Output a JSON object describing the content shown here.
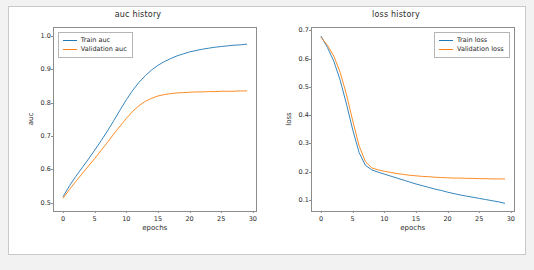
{
  "figure": {
    "background": "#ffffff",
    "page_background": "#f2f2f2",
    "border_color": "#c9c9c9"
  },
  "chart_data": [
    {
      "type": "line",
      "title": "auc history",
      "xlabel": "epochs",
      "ylabel": "auc",
      "xlim": [
        -1.45,
        30.45
      ],
      "ylim": [
        0.4755,
        1.0245
      ],
      "xticks": [
        "0",
        "5",
        "10",
        "15",
        "20",
        "25",
        "30"
      ],
      "xtick_values": [
        0,
        5,
        10,
        15,
        20,
        25,
        30
      ],
      "yticks": [
        "0.5",
        "0.6",
        "0.7",
        "0.8",
        "0.9",
        "1.0"
      ],
      "ytick_values": [
        0.5,
        0.6,
        0.7,
        0.8,
        0.9,
        1.0
      ],
      "grid": false,
      "legend_position": "upper left",
      "x": [
        0,
        1,
        2,
        3,
        4,
        5,
        6,
        7,
        8,
        9,
        10,
        11,
        12,
        13,
        14,
        15,
        16,
        17,
        18,
        19,
        20,
        21,
        22,
        23,
        24,
        25,
        26,
        27,
        28,
        29
      ],
      "series": [
        {
          "name": "Train auc",
          "color": "#1f77b4",
          "values": [
            0.52,
            0.552,
            0.58,
            0.606,
            0.632,
            0.659,
            0.687,
            0.716,
            0.747,
            0.779,
            0.81,
            0.838,
            0.862,
            0.882,
            0.899,
            0.913,
            0.924,
            0.933,
            0.941,
            0.947,
            0.953,
            0.957,
            0.961,
            0.964,
            0.967,
            0.969,
            0.971,
            0.973,
            0.974,
            0.976
          ]
        },
        {
          "name": "Validation auc",
          "color": "#ff7f0e",
          "values": [
            0.515,
            0.541,
            0.565,
            0.588,
            0.611,
            0.634,
            0.658,
            0.682,
            0.707,
            0.731,
            0.754,
            0.775,
            0.792,
            0.805,
            0.814,
            0.821,
            0.825,
            0.828,
            0.83,
            0.831,
            0.832,
            0.833,
            0.833,
            0.834,
            0.834,
            0.835,
            0.835,
            0.835,
            0.836,
            0.836
          ]
        }
      ]
    },
    {
      "type": "line",
      "title": "loss history",
      "xlabel": "epochs",
      "ylabel": "loss",
      "xlim": [
        -1.45,
        30.45
      ],
      "ylim": [
        0.0605,
        0.7095
      ],
      "xticks": [
        "0",
        "5",
        "10",
        "15",
        "20",
        "25",
        "30"
      ],
      "xtick_values": [
        0,
        5,
        10,
        15,
        20,
        25,
        30
      ],
      "yticks": [
        "0.1",
        "0.2",
        "0.3",
        "0.4",
        "0.5",
        "0.6",
        "0.7"
      ],
      "ytick_values": [
        0.1,
        0.2,
        0.3,
        0.4,
        0.5,
        0.6,
        0.7
      ],
      "grid": false,
      "legend_position": "upper right",
      "x": [
        0,
        1,
        2,
        3,
        4,
        5,
        6,
        7,
        8,
        9,
        10,
        11,
        12,
        13,
        14,
        15,
        16,
        17,
        18,
        19,
        20,
        21,
        22,
        23,
        24,
        25,
        26,
        27,
        28,
        29
      ],
      "series": [
        {
          "name": "Train loss",
          "color": "#1f77b4",
          "values": [
            0.68,
            0.64,
            0.592,
            0.525,
            0.44,
            0.348,
            0.268,
            0.223,
            0.207,
            0.199,
            0.192,
            0.185,
            0.178,
            0.171,
            0.164,
            0.157,
            0.151,
            0.145,
            0.139,
            0.134,
            0.128,
            0.123,
            0.118,
            0.114,
            0.11,
            0.106,
            0.102,
            0.098,
            0.094,
            0.089
          ]
        },
        {
          "name": "Validation loss",
          "color": "#ff7f0e",
          "values": [
            0.676,
            0.648,
            0.61,
            0.553,
            0.474,
            0.38,
            0.292,
            0.236,
            0.214,
            0.207,
            0.202,
            0.198,
            0.194,
            0.191,
            0.188,
            0.186,
            0.184,
            0.183,
            0.181,
            0.18,
            0.179,
            0.178,
            0.178,
            0.177,
            0.177,
            0.176,
            0.176,
            0.175,
            0.175,
            0.175
          ]
        }
      ]
    }
  ]
}
